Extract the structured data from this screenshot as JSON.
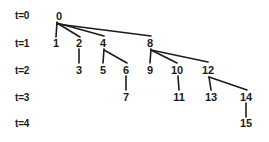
{
  "diagram": {
    "background_color": "#ffffff",
    "line_color": "#1c1c1c",
    "text_color": "#1c1c1c",
    "time_labels": [
      {
        "text": "t=0",
        "x": 15,
        "y": 15
      },
      {
        "text": "t=1",
        "x": 15,
        "y": 43
      },
      {
        "text": "t=2",
        "x": 15,
        "y": 70
      },
      {
        "text": "t=3",
        "x": 15,
        "y": 97
      },
      {
        "text": "t=4",
        "x": 15,
        "y": 123
      }
    ],
    "nodes": [
      {
        "id": "0",
        "label": "0",
        "x": 59,
        "y": 16,
        "level": 0
      },
      {
        "id": "1",
        "label": "1",
        "x": 56,
        "y": 43,
        "level": 1
      },
      {
        "id": "2",
        "label": "2",
        "x": 79,
        "y": 43,
        "level": 1
      },
      {
        "id": "4",
        "label": "4",
        "x": 103,
        "y": 43,
        "level": 1
      },
      {
        "id": "8",
        "label": "8",
        "x": 150,
        "y": 43,
        "level": 1
      },
      {
        "id": "3",
        "label": "3",
        "x": 79,
        "y": 70,
        "level": 2
      },
      {
        "id": "5",
        "label": "5",
        "x": 103,
        "y": 70,
        "level": 2
      },
      {
        "id": "6",
        "label": "6",
        "x": 126,
        "y": 70,
        "level": 2
      },
      {
        "id": "9",
        "label": "9",
        "x": 150,
        "y": 70,
        "level": 2
      },
      {
        "id": "10",
        "label": "10",
        "x": 177,
        "y": 70,
        "level": 2
      },
      {
        "id": "12",
        "label": "12",
        "x": 208,
        "y": 70,
        "level": 2
      },
      {
        "id": "7",
        "label": "7",
        "x": 126,
        "y": 97,
        "level": 3
      },
      {
        "id": "11",
        "label": "11",
        "x": 179,
        "y": 97,
        "level": 3
      },
      {
        "id": "13",
        "label": "13",
        "x": 211,
        "y": 97,
        "level": 3
      },
      {
        "id": "14",
        "label": "14",
        "x": 246,
        "y": 97,
        "level": 3
      },
      {
        "id": "15",
        "label": "15",
        "x": 246,
        "y": 123,
        "level": 4
      }
    ],
    "edges": [
      {
        "from": "0",
        "to": "1",
        "x1": 57,
        "y1": 22,
        "x2": 56,
        "y2": 37
      },
      {
        "from": "0",
        "to": "2",
        "x1": 57,
        "y1": 23,
        "x2": 80,
        "y2": 37
      },
      {
        "from": "0",
        "to": "4",
        "x1": 57,
        "y1": 23,
        "x2": 104,
        "y2": 36
      },
      {
        "from": "0",
        "to": "8",
        "x1": 57,
        "y1": 24,
        "x2": 151,
        "y2": 36
      },
      {
        "from": "2",
        "to": "3",
        "x1": 79,
        "y1": 49,
        "x2": 79,
        "y2": 63
      },
      {
        "from": "4",
        "to": "5",
        "x1": 104,
        "y1": 49,
        "x2": 103,
        "y2": 63
      },
      {
        "from": "4",
        "to": "6",
        "x1": 104,
        "y1": 50,
        "x2": 127,
        "y2": 63
      },
      {
        "from": "8",
        "to": "9",
        "x1": 151,
        "y1": 49,
        "x2": 150,
        "y2": 63
      },
      {
        "from": "8",
        "to": "10",
        "x1": 151,
        "y1": 50,
        "x2": 177,
        "y2": 63
      },
      {
        "from": "8",
        "to": "12",
        "x1": 151,
        "y1": 50,
        "x2": 208,
        "y2": 62
      },
      {
        "from": "6",
        "to": "7",
        "x1": 126,
        "y1": 76,
        "x2": 126,
        "y2": 90
      },
      {
        "from": "10",
        "to": "11",
        "x1": 178,
        "y1": 76,
        "x2": 179,
        "y2": 90
      },
      {
        "from": "12",
        "to": "13",
        "x1": 209,
        "y1": 77,
        "x2": 211,
        "y2": 90
      },
      {
        "from": "12",
        "to": "14",
        "x1": 209,
        "y1": 77,
        "x2": 247,
        "y2": 90
      },
      {
        "from": "14",
        "to": "15",
        "x1": 246,
        "y1": 103,
        "x2": 246,
        "y2": 117
      }
    ]
  }
}
